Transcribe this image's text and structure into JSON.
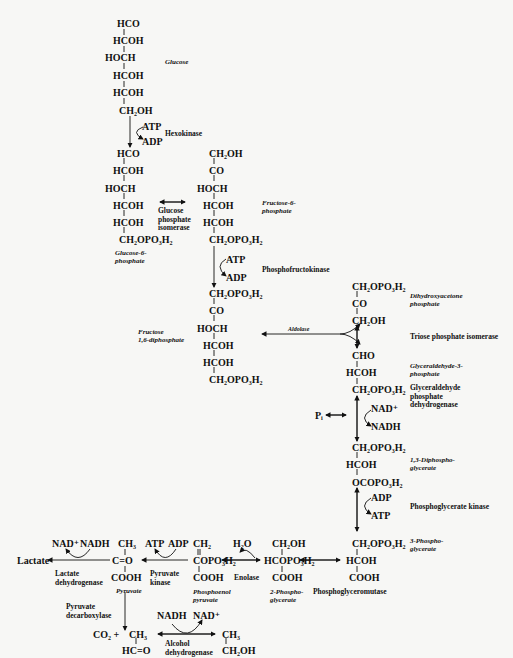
{
  "diagram": {
    "type": "metabolic-pathway",
    "glucose": {
      "atoms": [
        "HCO",
        "HCOH",
        "HOCH",
        "HCOH",
        "HCOH",
        "CH₂OH"
      ],
      "label": "Glucose"
    },
    "hexokinase_step": {
      "in": "ATP",
      "out": "ADP",
      "enzyme": "Hexokinase"
    },
    "glucose_6_phosphate": {
      "atoms": [
        "HCO",
        "HCOH",
        "HOCH",
        "HCOH",
        "HCOH",
        "CH₂OPO₃H₂"
      ],
      "label": "Glucose-6-\nphosphate"
    },
    "isomerase_step": {
      "enzyme": "Glucose\nphosphate\nisomerase"
    },
    "fructose_6_phosphate": {
      "atoms": [
        "CH₂OH",
        "CO",
        "HOCH",
        "HCOH",
        "HCOH",
        "CH₂OPO₃H₂"
      ],
      "label": "Fructose-6-\nphosphate"
    },
    "pfk_step": {
      "in": "ATP",
      "out": "ADP",
      "enzyme": "Phosphofructokinase"
    },
    "fructose_16_diphosphate": {
      "atoms": [
        "CH₂OPO₃H₂",
        "CO",
        "HOCH",
        "HCOH",
        "HCOH",
        "CH₂OPO₃H₂"
      ],
      "label": "Fructose\n1,6-diphosphate"
    },
    "aldolase_step": {
      "enzyme": "Aldolase"
    },
    "dihydroxyacetone_phosphate": {
      "atoms": [
        "CH₂OPO₃H₂",
        "CO",
        "CH₂OH"
      ],
      "label": "Dihydroxyacetone\nphosphate"
    },
    "triose_step": {
      "enzyme": "Triose phosphate isomerase"
    },
    "glyceraldehyde_3_phosphate": {
      "atoms": [
        "CHO",
        "HCOH",
        "CH₂OPO₃H₂"
      ],
      "label": "Glyceraldehyde-3-\nphosphate"
    },
    "gapdh_step": {
      "in": "NAD⁺",
      "out": "NADH",
      "pi": "Pᵢ",
      "enzyme": "Glyceraldehyde\nphosphate\ndehydrogenase"
    },
    "diphosphoglycerate": {
      "atoms": [
        "CH₂OPO₃H₂",
        "HCOH",
        "OCOPO₃H₂"
      ],
      "label": "1,3-Diphospho-\nglycerate"
    },
    "pgk_step": {
      "in": "ADP",
      "out": "ATP",
      "enzyme": "Phosphoglycerate kinase"
    },
    "phosphoglycerate_3": {
      "atoms": [
        "CH₂OPO₃H₂",
        "HCOH",
        "COOH"
      ],
      "label": "3-Phospho-\nglycerate"
    },
    "mutase_step": {
      "enzyme": "Phosphoglyceromutase"
    },
    "phosphoglycerate_2": {
      "atoms": [
        "CH₂OH",
        "HCOPO₃H₂",
        "COOH"
      ],
      "label": "2-Phospho-\nglycerate"
    },
    "enolase_step": {
      "out": "H₂O",
      "enzyme": "Enolase"
    },
    "phosphoenolpyruvate": {
      "atoms": [
        "CH₂",
        "COPO₃H₂",
        "COOH"
      ],
      "label": "Phosphoenol\npyruvate"
    },
    "pyruvate_kinase_step": {
      "in": "ATP",
      "out": "ADP",
      "enzyme": "Pyruvate\nkinase"
    },
    "pyruvate": {
      "atoms": [
        "CH₃",
        "C=O",
        "COOH"
      ],
      "label": "Pyruvate"
    },
    "ldh_step": {
      "in": "NAD⁺",
      "out": "NADH",
      "enzyme": "Lactate\ndehydrogenase",
      "product": "Lactate"
    },
    "pdc_step": {
      "enzyme": "Pyruvate\ndecarboxylase",
      "co2": "CO₂ +"
    },
    "acetaldehyde": {
      "atoms": [
        "CH₃",
        "HC=O"
      ]
    },
    "adh_step": {
      "in": "NADH",
      "out": "NAD⁺",
      "enzyme": "Alcohol\ndehydrogenase"
    },
    "ethanol": {
      "atoms": [
        "CH₃",
        "CH₂OH"
      ]
    }
  }
}
